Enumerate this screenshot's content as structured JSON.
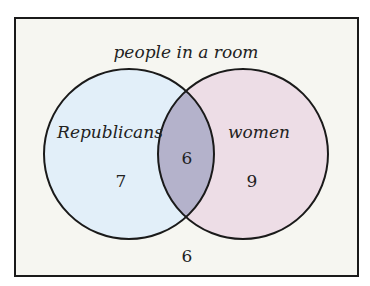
{
  "diagram": {
    "type": "venn",
    "universe_label": "people in a room",
    "sets": [
      {
        "label": "Republicans",
        "only_count": "7",
        "color": "#e2eff9"
      },
      {
        "label": "women",
        "only_count": "9",
        "color": "#eddde6"
      }
    ],
    "intersection_count": "6",
    "intersection_color": "#b4b2cb",
    "outside_count": "6",
    "background_color": "#f6f6f1",
    "border_color": "#1a1a1a"
  }
}
